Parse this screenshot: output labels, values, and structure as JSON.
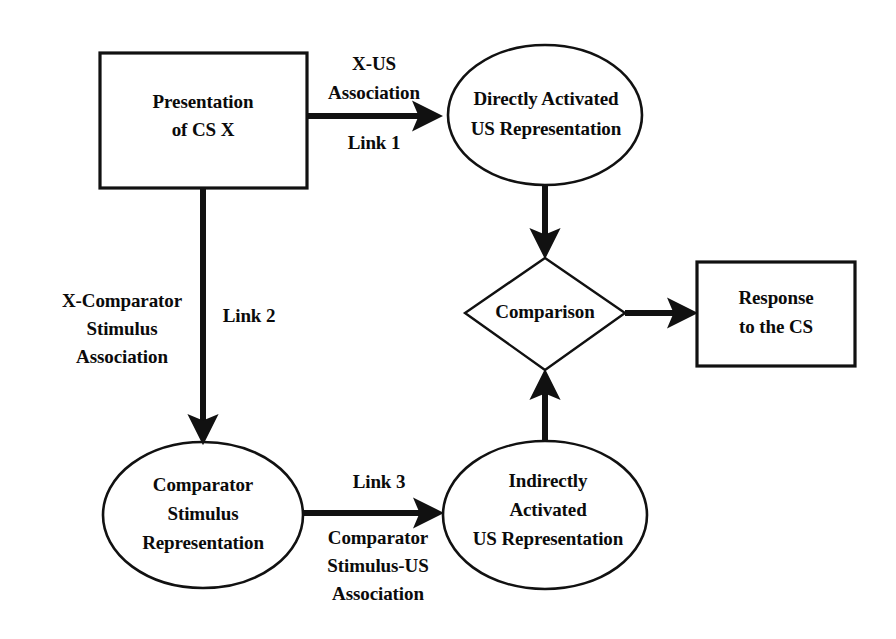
{
  "figure": {
    "type": "flow-diagram",
    "background_color": "#ffffff",
    "line_color": "#111111",
    "text_color": "#0b0b0b"
  },
  "nodes": {
    "presentation_cs_x": {
      "shape": "rectangle",
      "lines": [
        "Presentation",
        "of CS X"
      ]
    },
    "directly_activated": {
      "shape": "ellipse",
      "lines": [
        "Directly Activated",
        "US Representation"
      ]
    },
    "comparison": {
      "shape": "diamond",
      "lines": [
        "Comparison"
      ]
    },
    "response_to_cs": {
      "shape": "rectangle",
      "lines": [
        "Response",
        "to the CS"
      ]
    },
    "comparator_stimulus": {
      "shape": "ellipse",
      "lines": [
        "Comparator",
        "Stimulus",
        "Representation"
      ]
    },
    "indirectly_activated": {
      "shape": "ellipse",
      "lines": [
        "Indirectly",
        "Activated",
        "US Representation"
      ]
    }
  },
  "edge_labels": {
    "x_us_association": [
      "X-US",
      "Association"
    ],
    "link1": [
      "Link 1"
    ],
    "x_comparator_association": [
      "X-Comparator",
      "Stimulus",
      "Association"
    ],
    "link2": [
      "Link 2"
    ],
    "link3": [
      "Link 3"
    ],
    "comparator_stimulus_us_association": [
      "Comparator",
      "Stimulus-US",
      "Association"
    ]
  }
}
